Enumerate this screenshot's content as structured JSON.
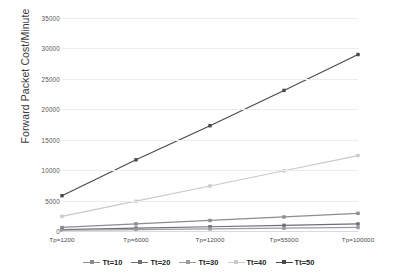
{
  "chart_data": {
    "type": "line",
    "title": "",
    "xlabel": "",
    "ylabel": "Forward Packet Cost/Minute",
    "categories": [
      "Tp=1200",
      "Tp=6000",
      "Tp=12000",
      "Tp=55000",
      "Tp=100000"
    ],
    "yticks": [
      0,
      5000,
      10000,
      15000,
      20000,
      25000,
      30000,
      35000
    ],
    "ylim": [
      0,
      35000
    ],
    "grid": true,
    "legend_position": "bottom",
    "series": [
      {
        "name": "Tt=10",
        "color": "#8c8c91",
        "values": [
          580,
          1170,
          1730,
          2310,
          2900
        ]
      },
      {
        "name": "Tt=20",
        "color": "#6e6e73",
        "values": [
          240,
          470,
          700,
          930,
          1160
        ]
      },
      {
        "name": "Tt=30",
        "color": "#9a9a9f",
        "values": [
          120,
          240,
          350,
          460,
          580
        ]
      },
      {
        "name": "Tt=40",
        "color": "#c9c9ce",
        "values": [
          2400,
          4900,
          7400,
          9900,
          12400
        ]
      },
      {
        "name": "Tt=50",
        "color": "#4a4a50",
        "values": [
          5800,
          11700,
          17300,
          23100,
          29000
        ]
      }
    ]
  },
  "axis": {
    "y_title": "Forward Packet Cost/Minute",
    "y_tick_labels": [
      "35000",
      "30000",
      "25000",
      "20000",
      "15000",
      "10000",
      "5000",
      "0"
    ],
    "x_tick_labels": [
      "Tp=1200",
      "Tp=6000",
      "Tp=12000",
      "Tp=55000",
      "Tp=100000"
    ]
  },
  "legend": {
    "items": [
      {
        "label": "Tt=10"
      },
      {
        "label": "Tt=20"
      },
      {
        "label": "Tt=30"
      },
      {
        "label": "Tt=40"
      },
      {
        "label": "Tt=50"
      }
    ]
  },
  "colors": {
    "grid": "#ececf0",
    "background": "#ffffff",
    "text": "#3a3a3a"
  }
}
